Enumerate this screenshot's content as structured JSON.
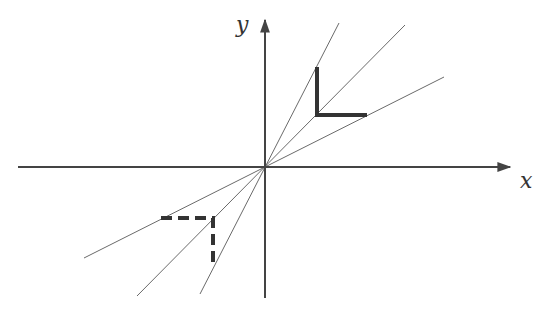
{
  "diagram": {
    "type": "coordinate-plane-linear-map",
    "axes": {
      "x_label": "x",
      "y_label": "y",
      "origin": [
        265,
        167
      ],
      "x_axis": {
        "from": [
          18,
          167
        ],
        "to": [
          510,
          167
        ]
      },
      "y_axis": {
        "from": [
          265,
          298
        ],
        "to": [
          265,
          20
        ]
      },
      "color": "#444444"
    },
    "lines": [
      {
        "name": "steep-line",
        "from": [
          200,
          294
        ],
        "to": [
          339,
          23
        ]
      },
      {
        "name": "diagonal-line",
        "from": [
          137,
          296
        ],
        "to": [
          405,
          25
        ]
      },
      {
        "name": "shallow-line",
        "from": [
          84,
          258
        ],
        "to": [
          444,
          77
        ]
      }
    ],
    "shapes": [
      {
        "name": "solid-L",
        "style": "solid",
        "points": [
          [
            317,
            67
          ],
          [
            317,
            115
          ],
          [
            367,
            115
          ]
        ]
      },
      {
        "name": "dashed-L",
        "style": "dashed",
        "points": [
          [
            161,
            218
          ],
          [
            213,
            218
          ],
          [
            213,
            267
          ]
        ]
      }
    ],
    "colors": {
      "line": "#555555",
      "shape": "#333333",
      "background": "#ffffff"
    }
  }
}
